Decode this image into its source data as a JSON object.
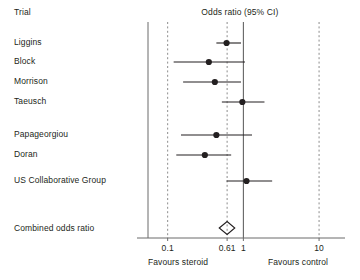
{
  "table": {
    "column_header": "Trial",
    "plot_header": "Odds ratio (95% CI)",
    "summary_row_label": "Combined odds ratio"
  },
  "axis": {
    "ticks": [
      {
        "value": 0.1,
        "label": "0.1"
      },
      {
        "value": 0.61,
        "label": "0.61"
      },
      {
        "value": 1,
        "label": "1"
      },
      {
        "value": 10,
        "label": "10"
      }
    ],
    "scale": "log",
    "null_value": 1,
    "range": [
      0.055,
      22
    ],
    "left_label": "Favours steroid",
    "right_label": "Favours control"
  },
  "chart_data": {
    "type": "forest",
    "title": "Odds ratio (95% CI)",
    "xlabel": "Odds ratio (95% CI)",
    "ylabel": "Trial",
    "scale": "log",
    "xlim": [
      0.055,
      22
    ],
    "xticks": [
      0.1,
      0.61,
      1,
      10
    ],
    "xtick_labels": [
      "0.1",
      "0.61",
      "1",
      "10"
    ],
    "reference_line": 1,
    "grid": true,
    "favours_left": "Favours steroid",
    "favours_right": "Favours control",
    "studies": [
      {
        "name": "Liggins",
        "or": 0.6,
        "ci_low": 0.44,
        "ci_high": 0.93
      },
      {
        "name": "Block",
        "or": 0.35,
        "ci_low": 0.12,
        "ci_high": 1.05
      },
      {
        "name": "Morrison",
        "or": 0.42,
        "ci_low": 0.16,
        "ci_high": 0.93
      },
      {
        "name": "Taeusch",
        "or": 0.97,
        "ci_low": 0.52,
        "ci_high": 1.9
      },
      {
        "name": "Papageorgiou",
        "or": 0.44,
        "ci_low": 0.15,
        "ci_high": 1.3
      },
      {
        "name": "Doran",
        "or": 0.31,
        "ci_low": 0.13,
        "ci_high": 0.69
      },
      {
        "name": "US Collaborative Group",
        "or": 1.1,
        "ci_low": 0.6,
        "ci_high": 2.4
      }
    ],
    "combined": {
      "name": "Combined odds ratio",
      "or": 0.61,
      "ci_low": 0.48,
      "ci_high": 0.77
    }
  }
}
